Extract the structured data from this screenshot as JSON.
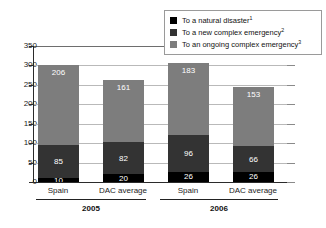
{
  "chart_data": {
    "type": "bar",
    "subtype": "stacked",
    "title": "",
    "xlabel": "",
    "ylabel": "",
    "ylim": [
      0,
      350
    ],
    "ytick_step": 50,
    "yticks": [
      "350",
      "300",
      "250",
      "200",
      "150",
      "100",
      "50",
      "0"
    ],
    "grid": true,
    "legend_position": "top-right",
    "categories": [
      "Spain",
      "DAC average",
      "Spain",
      "DAC average"
    ],
    "groups": [
      {
        "label": "2005",
        "categories": [
          "Spain",
          "DAC average"
        ]
      },
      {
        "label": "2006",
        "categories": [
          "Spain",
          "DAC average"
        ]
      }
    ],
    "series": [
      {
        "name": "To a natural disaster",
        "footnote": "1",
        "color": "#000000",
        "values": [
          10,
          20,
          26,
          26
        ]
      },
      {
        "name": "To a new complex emergency",
        "footnote": "2",
        "color": "#333333",
        "values": [
          85,
          82,
          96,
          66
        ]
      },
      {
        "name": "To an ongoing complex emergency",
        "footnote": "3",
        "color": "#7d7d7d",
        "values": [
          206,
          161,
          183,
          153
        ]
      }
    ],
    "totals": [
      301,
      263,
      305,
      245
    ]
  },
  "legend": {
    "items": [
      {
        "label": "To a natural disaster",
        "sup": "1",
        "color": "#000000"
      },
      {
        "label": "To a new complex emergency",
        "sup": "2",
        "color": "#333333"
      },
      {
        "label": "To an ongoing complex emergency",
        "sup": "3",
        "color": "#7d7d7d"
      }
    ]
  },
  "axis": {
    "y": {
      "t350": "350",
      "t300": "300",
      "t250": "250",
      "t200": "200",
      "t150": "150",
      "t100": "100",
      "t50": "50",
      "t0": "0"
    }
  },
  "bars": [
    {
      "category": "Spain",
      "group": "2005",
      "natural": "10",
      "new": "85",
      "ongoing": "206"
    },
    {
      "category": "DAC average",
      "group": "2005",
      "natural": "20",
      "new": "82",
      "ongoing": "161"
    },
    {
      "category": "Spain",
      "group": "2006",
      "natural": "26",
      "new": "96",
      "ongoing": "183"
    },
    {
      "category": "DAC average",
      "group": "2006",
      "natural": "26",
      "new": "66",
      "ongoing": "153"
    }
  ],
  "groups": [
    {
      "label": "2005"
    },
    {
      "label": "2006"
    }
  ]
}
